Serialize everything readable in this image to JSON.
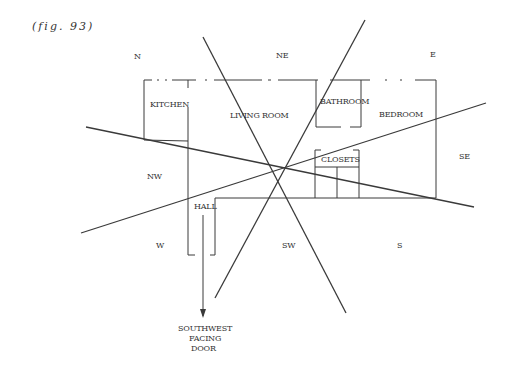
{
  "figure": {
    "caption": "(fig. 93)"
  },
  "directions": {
    "n": "N",
    "ne": "NE",
    "e": "E",
    "se": "SE",
    "s": "S",
    "sw": "SW",
    "w": "W",
    "nw": "NW"
  },
  "rooms": {
    "kitchen": "KITCHEN",
    "living_room": "LIVING ROOM",
    "bathroom": "BATHROOM",
    "bedroom": "BEDROOM",
    "closets": "CLOSETS",
    "hall": "HALL"
  },
  "door": {
    "line1": "SOUTHWEST",
    "line2": "FACING",
    "line3": "DOOR"
  },
  "colors": {
    "ink": "#3a3a3a",
    "background": "#ffffff"
  }
}
